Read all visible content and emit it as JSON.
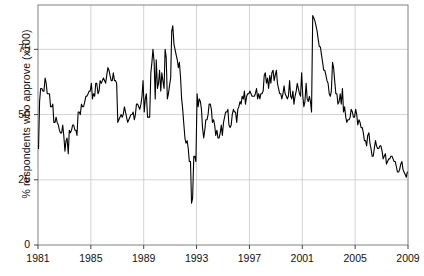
{
  "chart_data": {
    "type": "line",
    "title": "",
    "xlabel": "",
    "ylabel": "% respondents who approve (x100)",
    "xlim": [
      1981.0,
      2009.0
    ],
    "ylim": [
      0,
      92
    ],
    "xticks": [
      "1981",
      "1985",
      "1989",
      "1993",
      "1997",
      "2001",
      "2005",
      "2009"
    ],
    "xtick_values": [
      1981,
      1985,
      1989,
      1993,
      1997,
      2001,
      2005,
      2009
    ],
    "yticks": [
      "0",
      "25",
      "50",
      "75"
    ],
    "ytick_values": [
      0,
      25,
      50,
      75
    ],
    "grid": true,
    "legend": "none",
    "line_color": "#000000",
    "grid_color": "#c8c8c8",
    "frame_color": "#808080",
    "background": "#ffffff",
    "series": [
      {
        "name": "presidential approval",
        "x": [
          1981.04,
          1981.12,
          1981.2,
          1981.29,
          1981.37,
          1981.45,
          1981.54,
          1981.62,
          1981.7,
          1981.79,
          1981.87,
          1981.95,
          1982.04,
          1982.12,
          1982.2,
          1982.29,
          1982.37,
          1982.45,
          1982.54,
          1982.62,
          1982.7,
          1982.79,
          1982.87,
          1982.95,
          1983.04,
          1983.12,
          1983.2,
          1983.29,
          1983.37,
          1983.45,
          1983.54,
          1983.62,
          1983.7,
          1983.79,
          1983.87,
          1983.95,
          1984.04,
          1984.12,
          1984.2,
          1984.29,
          1984.37,
          1984.45,
          1984.54,
          1984.62,
          1984.7,
          1984.79,
          1984.87,
          1984.95,
          1985.04,
          1985.12,
          1985.2,
          1985.29,
          1985.37,
          1985.45,
          1985.54,
          1985.62,
          1985.7,
          1985.79,
          1985.87,
          1985.95,
          1986.04,
          1986.12,
          1986.2,
          1986.29,
          1986.37,
          1986.45,
          1986.54,
          1986.62,
          1986.7,
          1986.79,
          1986.87,
          1986.95,
          1987.04,
          1987.12,
          1987.2,
          1987.29,
          1987.37,
          1987.45,
          1987.54,
          1987.62,
          1987.7,
          1987.79,
          1987.87,
          1987.95,
          1988.04,
          1988.12,
          1988.2,
          1988.29,
          1988.37,
          1988.45,
          1988.54,
          1988.62,
          1988.7,
          1988.79,
          1988.87,
          1988.95,
          1989.04,
          1989.12,
          1989.2,
          1989.29,
          1989.37,
          1989.45,
          1989.54,
          1989.62,
          1989.7,
          1989.79,
          1989.87,
          1989.95,
          1990.04,
          1990.12,
          1990.2,
          1990.29,
          1990.37,
          1990.45,
          1990.54,
          1990.62,
          1990.7,
          1990.79,
          1990.87,
          1990.95,
          1991.04,
          1991.12,
          1991.2,
          1991.29,
          1991.37,
          1991.45,
          1991.54,
          1991.62,
          1991.7,
          1991.79,
          1991.87,
          1991.95,
          1992.04,
          1992.12,
          1992.2,
          1992.29,
          1992.37,
          1992.45,
          1992.54,
          1992.62,
          1992.7,
          1992.79,
          1992.87,
          1992.95,
          1993.04,
          1993.12,
          1993.2,
          1993.29,
          1993.37,
          1993.45,
          1993.54,
          1993.62,
          1993.7,
          1993.79,
          1993.87,
          1993.95,
          1994.04,
          1994.12,
          1994.2,
          1994.29,
          1994.37,
          1994.45,
          1994.54,
          1994.62,
          1994.7,
          1994.79,
          1994.87,
          1994.95,
          1995.04,
          1995.12,
          1995.2,
          1995.29,
          1995.37,
          1995.45,
          1995.54,
          1995.62,
          1995.7,
          1995.79,
          1995.87,
          1995.95,
          1996.04,
          1996.12,
          1996.2,
          1996.29,
          1996.37,
          1996.45,
          1996.54,
          1996.62,
          1996.7,
          1996.79,
          1996.87,
          1996.95,
          1997.04,
          1997.12,
          1997.2,
          1997.29,
          1997.37,
          1997.45,
          1997.54,
          1997.62,
          1997.7,
          1997.79,
          1997.87,
          1997.95,
          1998.04,
          1998.12,
          1998.2,
          1998.29,
          1998.37,
          1998.45,
          1998.54,
          1998.62,
          1998.7,
          1998.79,
          1998.87,
          1998.95,
          1999.04,
          1999.12,
          1999.2,
          1999.29,
          1999.37,
          1999.45,
          1999.54,
          1999.62,
          1999.7,
          1999.79,
          1999.87,
          1999.95,
          2000.04,
          2000.12,
          2000.2,
          2000.29,
          2000.37,
          2000.45,
          2000.54,
          2000.62,
          2000.7,
          2000.79,
          2000.87,
          2000.95,
          2001.04,
          2001.12,
          2001.2,
          2001.29,
          2001.37,
          2001.45,
          2001.54,
          2001.62,
          2001.7,
          2001.79,
          2001.87,
          2001.95,
          2002.04,
          2002.12,
          2002.2,
          2002.29,
          2002.37,
          2002.45,
          2002.54,
          2002.62,
          2002.7,
          2002.79,
          2002.87,
          2002.95,
          2003.04,
          2003.12,
          2003.2,
          2003.29,
          2003.37,
          2003.45,
          2003.54,
          2003.62,
          2003.7,
          2003.79,
          2003.87,
          2003.95,
          2004.04,
          2004.12,
          2004.2,
          2004.29,
          2004.37,
          2004.45,
          2004.54,
          2004.62,
          2004.7,
          2004.79,
          2004.87,
          2004.95,
          2005.04,
          2005.12,
          2005.2,
          2005.29,
          2005.37,
          2005.45,
          2005.54,
          2005.62,
          2005.7,
          2005.79,
          2005.87,
          2005.95,
          2006.04,
          2006.12,
          2006.2,
          2006.29,
          2006.37,
          2006.45,
          2006.54,
          2006.62,
          2006.7,
          2006.79,
          2006.87,
          2006.95,
          2007.04,
          2007.12,
          2007.2,
          2007.29,
          2007.37,
          2007.45,
          2007.54,
          2007.62,
          2007.7,
          2007.79,
          2007.87,
          2007.95,
          2008.04,
          2008.12,
          2008.2,
          2008.29,
          2008.37,
          2008.45,
          2008.54,
          2008.62,
          2008.7,
          2008.79,
          2008.87,
          2008.95
        ],
        "y": [
          37,
          55,
          60,
          60,
          59,
          59,
          64,
          62,
          58,
          58,
          58,
          53,
          53,
          54,
          47,
          47,
          49,
          47,
          46,
          44,
          43,
          43,
          46,
          42,
          36,
          40,
          41,
          35,
          44,
          43,
          44,
          46,
          46,
          44,
          44,
          42,
          51,
          51,
          50,
          54,
          53,
          53,
          55,
          57,
          57,
          58,
          59,
          59,
          62,
          56,
          58,
          57,
          62,
          62,
          58,
          59,
          63,
          62,
          63,
          64,
          63,
          62,
          65,
          68,
          67,
          65,
          63,
          63,
          66,
          63,
          63,
          62,
          47,
          48,
          49,
          50,
          49,
          50,
          53,
          51,
          49,
          47,
          48,
          49,
          50,
          50,
          51,
          48,
          50,
          54,
          54,
          53,
          52,
          54,
          57,
          63,
          51,
          56,
          58,
          49,
          49,
          49,
          66,
          70,
          75,
          70,
          56,
          71,
          60,
          62,
          67,
          59,
          66,
          63,
          60,
          75,
          72,
          56,
          58,
          61,
          64,
          82,
          84,
          77,
          75,
          73,
          71,
          68,
          70,
          64,
          56,
          52,
          46,
          41,
          39,
          40,
          37,
          32,
          32,
          16,
          18,
          34,
          34,
          32,
          58,
          53,
          56,
          55,
          52,
          45,
          41,
          44,
          48,
          48,
          50,
          54,
          54,
          52,
          47,
          48,
          46,
          42,
          44,
          41,
          41,
          43,
          46,
          42,
          47,
          49,
          51,
          51,
          52,
          46,
          45,
          46,
          50,
          52,
          51,
          51,
          47,
          52,
          53,
          55,
          54,
          57,
          56,
          59,
          54,
          57,
          58,
          58,
          59,
          58,
          57,
          57,
          57,
          58,
          60,
          56,
          58,
          56,
          58,
          58,
          59,
          65,
          66,
          62,
          64,
          60,
          65,
          62,
          66,
          67,
          63,
          65,
          67,
          62,
          60,
          58,
          58,
          56,
          58,
          61,
          58,
          57,
          56,
          57,
          63,
          57,
          56,
          59,
          54,
          57,
          59,
          62,
          60,
          58,
          57,
          66,
          57,
          53,
          55,
          62,
          56,
          55,
          57,
          55,
          51,
          88,
          87,
          86,
          84,
          82,
          79,
          76,
          76,
          73,
          70,
          67,
          67,
          65,
          63,
          62,
          58,
          57,
          59,
          70,
          68,
          63,
          58,
          58,
          54,
          55,
          58,
          54,
          60,
          51,
          53,
          49,
          47,
          48,
          48,
          49,
          52,
          51,
          49,
          49,
          52,
          50,
          46,
          48,
          47,
          45,
          45,
          43,
          40,
          40,
          38,
          42,
          43,
          39,
          37,
          34,
          34,
          37,
          40,
          38,
          37,
          37,
          38,
          38,
          36,
          33,
          34,
          35,
          31,
          32,
          33,
          33,
          34,
          34,
          33,
          32,
          32,
          30,
          28,
          28,
          29,
          31,
          32,
          29,
          28,
          27,
          26,
          28
        ]
      }
    ]
  },
  "axis": {
    "y_label_text": "% respondents who approve (x100)"
  }
}
